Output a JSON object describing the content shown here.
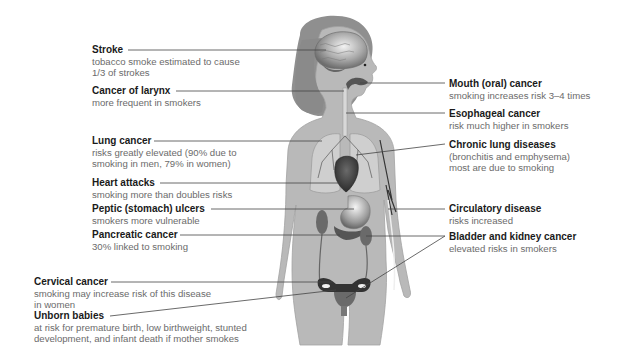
{
  "diagram": {
    "colors": {
      "body": "#b9b9b9",
      "body_outline": "#a2a2a2",
      "hair": "#8f8f8f",
      "organs_dark": "#4a4a4a",
      "organs_mid": "#7a7a7a",
      "lungs": "#cfcfcf",
      "leader_line": "#444444",
      "title_text": "#1a1a1a",
      "desc_text": "#6b6b6b"
    },
    "left_labels": [
      {
        "id": "stroke",
        "title": "Stroke",
        "desc_lines": [
          "tobacco smoke estimated to cause",
          "1/3 of strokes"
        ]
      },
      {
        "id": "larynx",
        "title": "Cancer of larynx",
        "desc_lines": [
          "more frequent in smokers"
        ]
      },
      {
        "id": "lung-cancer",
        "title": "Lung cancer",
        "desc_lines": [
          "risks greatly elevated (90% due to",
          "smoking in men, 79% in women)"
        ]
      },
      {
        "id": "heart-attacks",
        "title": "Heart attacks",
        "desc_lines": [
          "smoking more than doubles risks"
        ]
      },
      {
        "id": "peptic-ulcers",
        "title": "Peptic (stomach) ulcers",
        "desc_lines": [
          "smokers more vulnerable"
        ]
      },
      {
        "id": "pancreatic",
        "title": "Pancreatic cancer",
        "desc_lines": [
          "30% linked to smoking"
        ]
      },
      {
        "id": "cervical",
        "title": "Cervical cancer",
        "desc_lines": [
          "smoking may increase risk of this disease",
          "in women"
        ]
      },
      {
        "id": "unborn",
        "title": "Unborn babies",
        "desc_lines": [
          "at risk for premature birth, low birthweight, stunted",
          "development, and infant death if mother smokes"
        ]
      }
    ],
    "right_labels": [
      {
        "id": "mouth",
        "title": "Mouth (oral) cancer",
        "desc_lines": [
          "smoking increases risk 3–4 times"
        ]
      },
      {
        "id": "esophageal",
        "title": "Esophageal cancer",
        "desc_lines": [
          "risk much higher in smokers"
        ]
      },
      {
        "id": "chronic-lung",
        "title": "Chronic lung diseases",
        "desc_lines": [
          "(bronchitis and emphysema)",
          "most are due to smoking"
        ]
      },
      {
        "id": "circulatory",
        "title": "Circulatory disease",
        "desc_lines": [
          "risks increased"
        ]
      },
      {
        "id": "bladder-kidney",
        "title": "Bladder and kidney cancer",
        "desc_lines": [
          "elevated risks in smokers"
        ]
      }
    ]
  }
}
